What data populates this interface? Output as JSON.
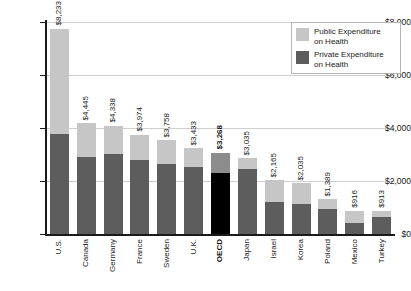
{
  "chart_data": {
    "type": "bar",
    "subtype": "stacked-bar",
    "title": "",
    "xlabel": "",
    "ylabel": "",
    "ylim": [
      0,
      8500
    ],
    "grid": true,
    "legend_position": "top-right",
    "y_ticks": [
      "$0",
      "$2,000",
      "$4,000",
      "$6,000",
      "$8,000"
    ],
    "y_tick_values": [
      0,
      2000,
      4000,
      6000,
      8000
    ],
    "categories": [
      "U.S.",
      "Canada",
      "Germany",
      "France",
      "Sweden",
      "U.K.",
      "OECD",
      "Japan",
      "Israel",
      "Korea",
      "Poland",
      "Mexico",
      "Turkey"
    ],
    "totals": [
      8233,
      4445,
      4338,
      3974,
      3758,
      3433,
      3268,
      3035,
      2165,
      2035,
      1389,
      916,
      913
    ],
    "data_labels": [
      "$8,233",
      "$4,445",
      "$4,338",
      "$3,974",
      "$3,758",
      "$3,433",
      "$3,268",
      "$3,035",
      "$2,165",
      "$2,035",
      "$1,389",
      "$916",
      "$913"
    ],
    "series": [
      {
        "name": "Private Expenditure on Health",
        "color": "#5d5d5d",
        "values": [
          4000,
          3100,
          3210,
          2950,
          2820,
          2700,
          2430,
          2590,
          1290,
          1210,
          990,
          450,
          670
        ]
      },
      {
        "name": "Public Expenditure on Health",
        "color": "#c6c6c6",
        "values": [
          4233,
          1345,
          1128,
          1024,
          938,
          733,
          838,
          445,
          875,
          825,
          399,
          466,
          243
        ]
      }
    ],
    "highlighted_category": "OECD",
    "highlight_colors": {
      "private": "#000000",
      "public": "#8c8c8c"
    }
  },
  "legend": {
    "items": [
      {
        "label_line1": "Public Expenditure",
        "label_line2": "on Health",
        "swatch": "light-gray-swatch"
      },
      {
        "label_line1": "Private Expenditure",
        "label_line2": "on Health",
        "swatch": "dark-gray-swatch"
      }
    ]
  }
}
